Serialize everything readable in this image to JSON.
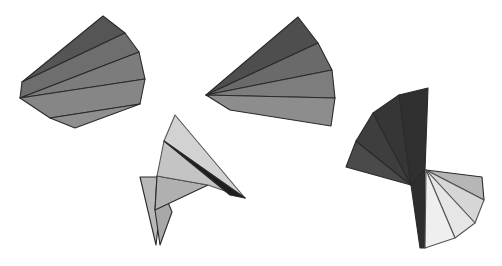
{
  "figure": {
    "width": 502,
    "height": 266,
    "background": "#ffffff",
    "shapes": [
      {
        "name": "fan-shape-top-left",
        "facets": [
          {
            "points": "22,82 103,16 125,33",
            "fill": "#555555"
          },
          {
            "points": "22,82 125,33 139,52 20,98",
            "fill": "#6e6e6e"
          },
          {
            "points": "20,98 139,52 145,79",
            "fill": "#7c7c7c"
          },
          {
            "points": "20,98 145,79 140,104 50,118",
            "fill": "#868686"
          },
          {
            "points": "50,118 140,104 75,128",
            "fill": "#8f8f8f"
          }
        ]
      },
      {
        "name": "fan-shape-top-middle",
        "facets": [
          {
            "points": "206,95 298,17 318,43",
            "fill": "#4e4e4e"
          },
          {
            "points": "206,95 318,43 332,70",
            "fill": "#6a6a6a"
          },
          {
            "points": "206,95 332,70 335,98",
            "fill": "#7d7d7d"
          },
          {
            "points": "206,95 335,98 331,126 230,110",
            "fill": "#8d8d8d"
          }
        ]
      },
      {
        "name": "folded-shape-bottom-center",
        "facets": [
          {
            "points": "140,177 160,177 160,210 156,245",
            "fill": "#b8b8b8"
          },
          {
            "points": "157,176 172,212 160,245 155,210",
            "fill": "#a8a8a8"
          },
          {
            "points": "157,176 208,185 155,210",
            "fill": "#b0b0b0"
          },
          {
            "points": "164,141 157,176 208,185 245,198",
            "fill": "#c4c4c4"
          },
          {
            "points": "175,115 245,198 164,141",
            "fill": "#d2d2d2"
          },
          {
            "points": "164,141 245,198 230,195 170,146",
            "fill": "#1e1e1e"
          }
        ]
      },
      {
        "name": "fan-shape-right",
        "facets": [
          {
            "points": "411,185 346,167 356,141",
            "fill": "#4a4a4a"
          },
          {
            "points": "411,185 356,141 373,113",
            "fill": "#3e3e3e"
          },
          {
            "points": "411,185 373,113 399,95",
            "fill": "#363636"
          },
          {
            "points": "411,185 399,95 428,88 425,170",
            "fill": "#303030"
          },
          {
            "points": "411,185 425,170 425,248 420,248",
            "fill": "#2e2e2e"
          },
          {
            "points": "426,170 482,177 484,200",
            "fill": "#b6b6b6"
          },
          {
            "points": "426,170 484,200 475,223",
            "fill": "#d6d6d6"
          },
          {
            "points": "426,170 475,223 455,238",
            "fill": "#e6e6e6"
          },
          {
            "points": "426,170 455,238 425,248",
            "fill": "#efefef"
          }
        ]
      }
    ]
  }
}
